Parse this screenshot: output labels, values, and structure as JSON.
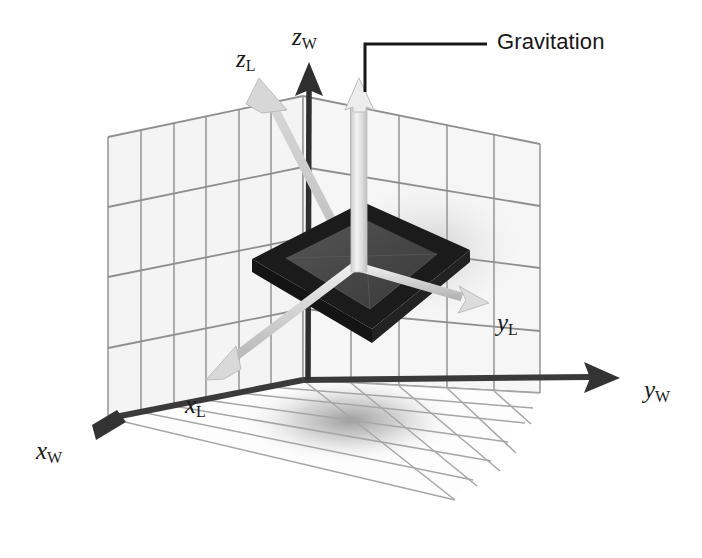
{
  "figure": {
    "kind": "3d-coordinate-frame-diagram",
    "width": 702,
    "height": 558,
    "background": "#ffffff"
  },
  "callouts": [
    {
      "id": "gravitation",
      "text": "Gravitation",
      "x": 497,
      "y": 29,
      "leader": {
        "from_x": 365,
        "from_y": 90,
        "corner_x": 365,
        "corner_y": 44,
        "to_x": 487,
        "to_y": 44
      }
    }
  ],
  "axis_labels": [
    {
      "id": "z-world",
      "base": "z",
      "sub": "W",
      "x": 292,
      "y": 24,
      "frame": "world"
    },
    {
      "id": "z-local",
      "base": "z",
      "sub": "L",
      "x": 236,
      "y": 46,
      "frame": "local"
    },
    {
      "id": "y-local",
      "base": "y",
      "sub": "L",
      "x": 497,
      "y": 310,
      "frame": "local"
    },
    {
      "id": "y-world",
      "base": "y",
      "sub": "W",
      "x": 644,
      "y": 377,
      "frame": "world"
    },
    {
      "id": "x-local",
      "base": "x",
      "sub": "L",
      "x": 185,
      "y": 392,
      "frame": "local"
    },
    {
      "id": "x-world",
      "base": "x",
      "sub": "W",
      "x": 36,
      "y": 438,
      "frame": "world"
    }
  ],
  "colors": {
    "world_axis": "#3a3a3a",
    "local_axis": "#c9c9c9",
    "local_axis_shadow": "#b0b0b0",
    "grid_line": "#8a8a8a",
    "grid_line_light": "#a8a8a8",
    "wall_fill": "#f2f2f2",
    "floor_fill": "#fdfdfd",
    "plate_frame": "#1b1b1b",
    "plate_face": "#4a4a4a",
    "gravity_arrow": "#e3e3e3",
    "gravity_arrow_edge": "#b5b5b5",
    "leader_line": "#171717",
    "text": "#171717",
    "shadow": "#b9b9b9"
  },
  "geometry": {
    "world_origin": {
      "x": 110,
      "y": 418
    },
    "local_origin": {
      "x": 355,
      "y": 265
    },
    "world_axes": [
      {
        "id": "x-world-axis",
        "to_x": 107,
        "to_y": 428,
        "head": "dark"
      },
      {
        "id": "y-world-axis",
        "to_x": 612,
        "to_y": 378,
        "head": "dark"
      },
      {
        "id": "z-world-axis",
        "to_x": 311,
        "to_y": 70,
        "head": "dark"
      }
    ],
    "local_axes": [
      {
        "id": "x-local-axis",
        "to_x": 219,
        "to_y": 369,
        "head": "light"
      },
      {
        "id": "y-local-axis",
        "to_x": 468,
        "to_y": 296,
        "head": "light"
      },
      {
        "id": "z-local-axis",
        "to_x": 266,
        "to_y": 93,
        "head": "light"
      }
    ],
    "gravity_arrow": {
      "base_x": 357,
      "base_y": 268,
      "tip_x": 365,
      "tip_y": 88
    },
    "back_wall_columns": 6,
    "back_wall_rows": 4,
    "right_wall_columns": 5,
    "right_wall_rows": 4,
    "floor_rows": 5,
    "floor_columns": 6
  }
}
